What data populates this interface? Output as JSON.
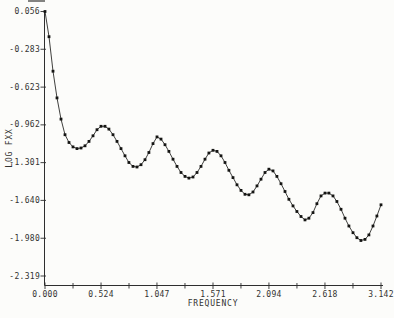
{
  "figure": {
    "background": "#fcfcfa",
    "ink": "#2e2e2e",
    "curve_color": "#1d1d1b"
  },
  "chart_data": {
    "type": "line",
    "title": "",
    "xlabel": "FREQUENCY",
    "ylabel": "LOG FXX",
    "grid": false,
    "legend": "none",
    "marker": "filled-square",
    "xlim": [
      0,
      3.142
    ],
    "ylim": [
      -2.319,
      0.056
    ],
    "x_tick_labels": [
      "0.000",
      "0.524",
      "1.047",
      "1.571",
      "2.094",
      "2.618",
      "3.142"
    ],
    "x_minor_ticks_between_majors": 1,
    "y_tick_labels": [
      "0.056",
      "-0.283",
      "-0.623",
      "-0.962",
      "-1.301",
      "-1.640",
      "-1.980",
      "-2.319"
    ],
    "series": [
      {
        "name": "log-spectral-density-estimate",
        "x": [
          0.0,
          0.037,
          0.075,
          0.112,
          0.15,
          0.187,
          0.224,
          0.262,
          0.299,
          0.337,
          0.374,
          0.411,
          0.449,
          0.486,
          0.524,
          0.561,
          0.598,
          0.636,
          0.673,
          0.711,
          0.748,
          0.785,
          0.823,
          0.86,
          0.898,
          0.935,
          0.972,
          1.01,
          1.047,
          1.085,
          1.122,
          1.159,
          1.197,
          1.234,
          1.272,
          1.309,
          1.346,
          1.384,
          1.421,
          1.459,
          1.496,
          1.533,
          1.571,
          1.608,
          1.646,
          1.683,
          1.72,
          1.758,
          1.795,
          1.833,
          1.87,
          1.907,
          1.945,
          1.982,
          2.02,
          2.057,
          2.094,
          2.132,
          2.169,
          2.207,
          2.244,
          2.281,
          2.319,
          2.356,
          2.394,
          2.431,
          2.468,
          2.506,
          2.543,
          2.581,
          2.618,
          2.655,
          2.693,
          2.73,
          2.768,
          2.805,
          2.842,
          2.88,
          2.917,
          2.954,
          2.992,
          3.029,
          3.067,
          3.104,
          3.142
        ],
        "y": [
          0.056,
          -0.17,
          -0.48,
          -0.72,
          -0.91,
          -1.05,
          -1.12,
          -1.16,
          -1.175,
          -1.17,
          -1.15,
          -1.11,
          -1.06,
          -1.005,
          -0.975,
          -0.975,
          -1.0,
          -1.05,
          -1.11,
          -1.175,
          -1.24,
          -1.3,
          -1.335,
          -1.34,
          -1.32,
          -1.275,
          -1.21,
          -1.13,
          -1.07,
          -1.09,
          -1.14,
          -1.2,
          -1.27,
          -1.335,
          -1.39,
          -1.425,
          -1.44,
          -1.43,
          -1.39,
          -1.335,
          -1.27,
          -1.215,
          -1.19,
          -1.2,
          -1.24,
          -1.3,
          -1.37,
          -1.435,
          -1.5,
          -1.55,
          -1.585,
          -1.59,
          -1.565,
          -1.51,
          -1.45,
          -1.39,
          -1.36,
          -1.375,
          -1.425,
          -1.49,
          -1.56,
          -1.63,
          -1.69,
          -1.74,
          -1.785,
          -1.815,
          -1.8,
          -1.75,
          -1.67,
          -1.6,
          -1.575,
          -1.575,
          -1.6,
          -1.65,
          -1.72,
          -1.8,
          -1.87,
          -1.93,
          -1.975,
          -2.0,
          -1.99,
          -1.95,
          -1.87,
          -1.78,
          -1.68
        ]
      }
    ]
  }
}
